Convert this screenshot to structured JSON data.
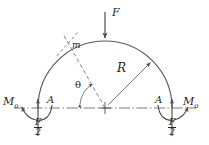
{
  "figure": {
    "type": "engineering-mechanics-diagram",
    "background_color": "#ffffff",
    "line_color": "#4d4d4d",
    "text_color": "#262626"
  },
  "labels": {
    "applied_load": "F",
    "section_point": "m",
    "radius": "R",
    "angle": "θ",
    "support_left": "A",
    "support_right": "A",
    "moment_left": "M",
    "moment_left_sub": "o",
    "moment_right": "M",
    "moment_right_sub": "o",
    "reaction_numerator_left": "F",
    "reaction_denominator_left": "2",
    "reaction_numerator_right": "F",
    "reaction_denominator_right": "2"
  },
  "geometry": {
    "center_x": 105,
    "center_y": 108,
    "radius_px": 67,
    "support_left_x": 38,
    "support_right_x": 172,
    "apex_x": 105,
    "apex_y": 41,
    "load_arrow_top_y": 12,
    "load_arrow_tip_y": 39,
    "section_angle_deg": 118,
    "radius_arrow_angle_deg": 45
  }
}
